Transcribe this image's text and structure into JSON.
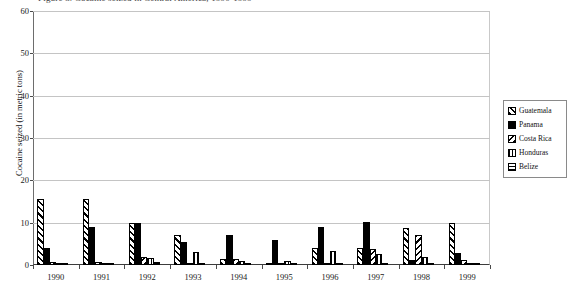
{
  "clipped_header_text": "Figure 3. Cocaine seized in Central America, 1990-1999",
  "chart_data": {
    "type": "bar",
    "title": "",
    "xlabel": "",
    "ylabel": "Cocaine seized (in metric tons)",
    "ylim": [
      0,
      60
    ],
    "yticks": [
      0,
      10,
      20,
      30,
      40,
      50,
      60
    ],
    "grid": true,
    "legend_position": "right",
    "categories": [
      "1990",
      "1991",
      "1992",
      "1993",
      "1994",
      "1995",
      "1996",
      "1997",
      "1998",
      "1999"
    ],
    "series": [
      {
        "name": "Guatemala",
        "pattern": "diagonal-hatch",
        "values": [
          15.5,
          15.5,
          10.0,
          7.0,
          1.5,
          0.3,
          4.0,
          4.0,
          8.8,
          10.0
        ]
      },
      {
        "name": "Panama",
        "pattern": "solid-black",
        "values": [
          4.0,
          9.0,
          10.0,
          5.5,
          7.0,
          6.0,
          9.0,
          10.2,
          1.2,
          2.8
        ]
      },
      {
        "name": "Costa Rica",
        "pattern": "backslash-hatch",
        "values": [
          0.7,
          0.8,
          2.0,
          0.3,
          1.5,
          0.5,
          0.5,
          3.7,
          7.2,
          1.3
        ]
      },
      {
        "name": "Honduras",
        "pattern": "vertical-lines",
        "values": [
          0.3,
          0.5,
          1.7,
          3.0,
          1.0,
          0.9,
          3.3,
          2.5,
          1.8,
          0.5
        ]
      },
      {
        "name": "Belize",
        "pattern": "horizontal-lines",
        "values": [
          0.1,
          0.1,
          0.8,
          0.1,
          0.1,
          0.4,
          0.1,
          0.2,
          0.2,
          0.1
        ]
      }
    ]
  },
  "legend": {
    "items": [
      {
        "label": "Guatemala"
      },
      {
        "label": "Panama"
      },
      {
        "label": "Costa Rica"
      },
      {
        "label": "Honduras"
      },
      {
        "label": "Belize"
      }
    ]
  },
  "colors": {
    "plot_background": "#ffffff",
    "gridline": "#c4c4c4",
    "axis": "#3c3c3c",
    "series_ink": "#000000"
  }
}
